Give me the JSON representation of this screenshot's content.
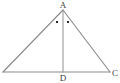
{
  "figure": {
    "background_color": "#ffffff",
    "stroke_color": "#8a8a8a",
    "cevian_stroke_color": "#9a9a9a",
    "label_color": "#3c3c3c",
    "marker_color": "#2b2b2b",
    "canvas": {
      "width": 120,
      "height": 83
    }
  },
  "points": {
    "A": {
      "label": "A",
      "x": 63,
      "y": 10,
      "label_x": 63,
      "label_y": 8
    },
    "B": {
      "label": "",
      "x": 3,
      "y": 72
    },
    "C": {
      "label": "C",
      "x": 110,
      "y": 72,
      "label_x": 115,
      "label_y": 76
    },
    "D": {
      "label": "D",
      "x": 63,
      "y": 72,
      "label_x": 63,
      "label_y": 81
    }
  },
  "segments": [
    {
      "name": "side-AB",
      "x1": 63,
      "y1": 10,
      "x2": 3,
      "y2": 72
    },
    {
      "name": "side-AC",
      "x1": 63,
      "y1": 10,
      "x2": 110,
      "y2": 72
    },
    {
      "name": "base-BC",
      "x1": 3,
      "y1": 72,
      "x2": 110,
      "y2": 72
    },
    {
      "name": "cevian-AD",
      "x1": 63,
      "y1": 11,
      "x2": 63,
      "y2": 72
    }
  ],
  "angle_markers": [
    {
      "name": "angle-marker-left",
      "x": 57.0,
      "y": 22.0,
      "size": 2.0
    },
    {
      "name": "angle-marker-right",
      "x": 68.0,
      "y": 22.0,
      "size": 2.0
    }
  ],
  "labels": {
    "apex": "A",
    "foot": "D",
    "right_base": "C"
  }
}
